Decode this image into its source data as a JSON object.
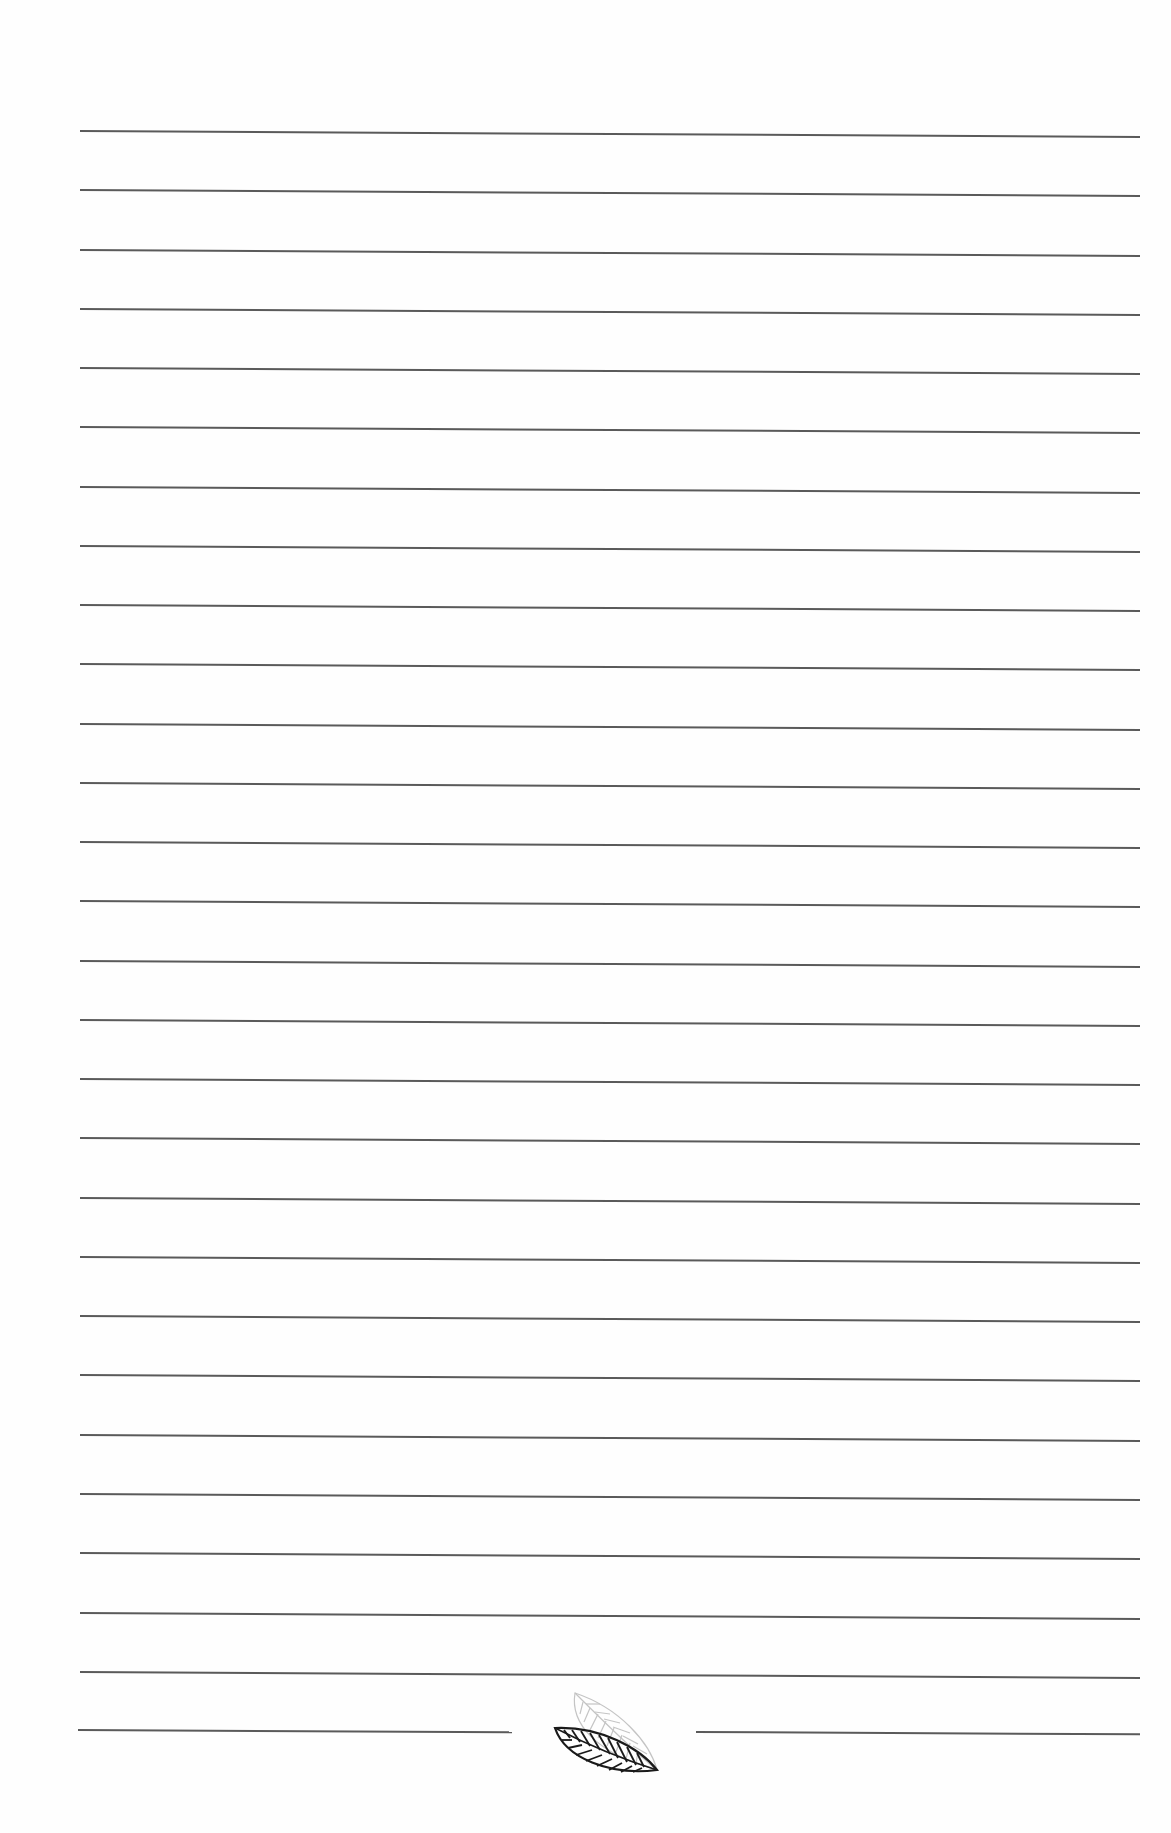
{
  "page": {
    "type": "lined-notebook-page",
    "background_color": "#fefefe",
    "rule_color": "#5a5a5a",
    "rule_count_full": 27,
    "rule_first_y": 130,
    "rule_spacing": 59.26,
    "rule_left_x": 80,
    "rule_right_x": 1140,
    "footer": {
      "split_rule_y": 1730,
      "left_segment": {
        "x1": 78,
        "x2": 512
      },
      "right_segment": {
        "x1": 696,
        "x2": 1135
      },
      "ornament": "leaf-icon"
    }
  }
}
